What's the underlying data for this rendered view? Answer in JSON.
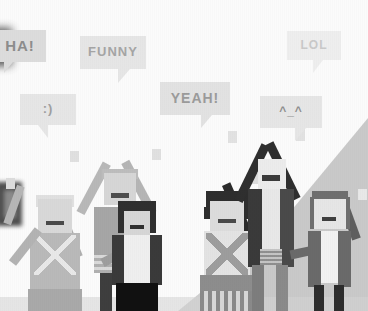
{
  "scene": {
    "title": "Cheering crowd illustration with speech bubbles",
    "style": "pixel-art grayscale crowd",
    "background_color": "#fbfbfb",
    "wall_color": "#cfcfcf",
    "bubble_fill": "#e4e4e4",
    "bubble_text_color": "#9a9a9a"
  },
  "bubbles": [
    {
      "id": "ha",
      "text": "HA!",
      "tail": "bottom-left",
      "fill": "#dcdcdc",
      "text_color": "#8d8d8d"
    },
    {
      "id": "funny",
      "text": "FUNNY",
      "tail": "bottom-right",
      "fill": "#e6e6e6",
      "text_color": "#a5a5a5"
    },
    {
      "id": "lol",
      "text": "LOL",
      "tail": "bottom-right",
      "fill": "#eeeeee",
      "text_color": "#c9c9c9"
    },
    {
      "id": "smile",
      "text": ":)",
      "tail": "bottom-left",
      "fill": "#e6e6e6",
      "text_color": "#a0a0a0"
    },
    {
      "id": "yeah",
      "text": "YEAH!",
      "tail": "bottom-right",
      "fill": "#e2e2e2",
      "text_color": "#9b9b9b"
    },
    {
      "id": "kao",
      "text": "^_^",
      "tail": "bottom-right",
      "fill": "#e6e6e6",
      "text_color": "#8f8f8f"
    }
  ],
  "figures": [
    {
      "id": "A",
      "name": "patterned-dress-figure-left",
      "arms": "both-raised"
    },
    {
      "id": "B",
      "name": "tall-figure-arms-v",
      "arms": "both-raised"
    },
    {
      "id": "C",
      "name": "dark-hair-jacket-figure",
      "arms": "one-raised"
    },
    {
      "id": "D",
      "name": "patterned-dress-figure-right",
      "arms": "one-raised"
    },
    {
      "id": "E",
      "name": "dark-coat-figure",
      "arms": "both-raised"
    },
    {
      "id": "F",
      "name": "gray-coat-figure-right",
      "arms": "one-raised"
    }
  ]
}
